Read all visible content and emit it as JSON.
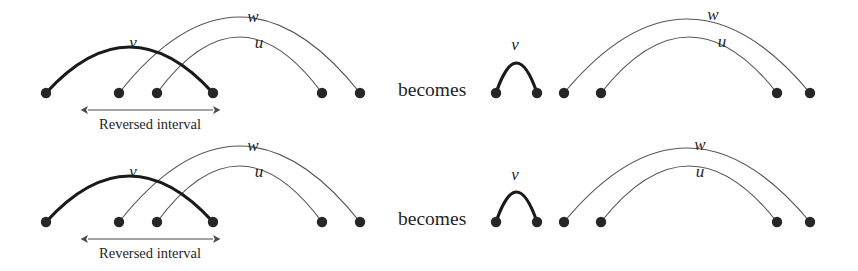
{
  "figure": {
    "width": 858,
    "height": 271,
    "background": "#ffffff",
    "colors": {
      "node": "#262626",
      "thick_arc": "#1a1a1a",
      "thin_arc": "#555555",
      "arrow": "#4a4a4a",
      "text": "#1f1f1f"
    },
    "stroke_widths": {
      "thick_arc": 3.2,
      "thin_arc": 1.1,
      "arrow": 1.1
    },
    "node_radius": 5.2
  },
  "connector": {
    "top_label": "becomes",
    "bottom_label": "becomes"
  },
  "labels": {
    "v": "v",
    "u": "u",
    "w": "w",
    "reversed_interval": "Reversed interval"
  },
  "panels": [
    {
      "id": "top-left",
      "name": "top-left-before-panel",
      "baseline_y": 93,
      "nodes": [
        {
          "id": "n1",
          "x": 46,
          "y": 93
        },
        {
          "id": "n2",
          "x": 119,
          "y": 93
        },
        {
          "id": "n3",
          "x": 157,
          "y": 93
        },
        {
          "id": "n4",
          "x": 213,
          "y": 93
        },
        {
          "id": "n5",
          "x": 322,
          "y": 93
        },
        {
          "id": "n6",
          "x": 360,
          "y": 93
        }
      ],
      "arcs": [
        {
          "label": "v",
          "from": "n1",
          "to": "n4",
          "style": "thick",
          "height": 46,
          "label_x": 133,
          "label_y": 48
        },
        {
          "label": "w",
          "from": "n2",
          "to": "n6",
          "style": "thin",
          "height": 76,
          "label_x": 253,
          "label_y": 22
        },
        {
          "label": "u",
          "from": "n3",
          "to": "n5",
          "style": "thin",
          "height": 56,
          "label_x": 259,
          "label_y": 48
        }
      ],
      "annotation": {
        "text": "Reversed interval",
        "arrow_from_x": 88,
        "arrow_to_x": 213,
        "arrow_y": 110,
        "text_x": 150,
        "text_y": 129
      }
    },
    {
      "id": "top-right",
      "name": "top-right-after-panel",
      "baseline_y": 93,
      "nodes": [
        {
          "id": "m1",
          "x": 496,
          "y": 93
        },
        {
          "id": "m2",
          "x": 537,
          "y": 93
        },
        {
          "id": "m3",
          "x": 564,
          "y": 93
        },
        {
          "id": "m4",
          "x": 601,
          "y": 93
        },
        {
          "id": "m5",
          "x": 777,
          "y": 93
        },
        {
          "id": "m6",
          "x": 810,
          "y": 93
        }
      ],
      "arcs": [
        {
          "label": "v",
          "from": "m1",
          "to": "m2",
          "style": "thick",
          "height": 30,
          "label_x": 515,
          "label_y": 50
        },
        {
          "label": "w",
          "from": "m3",
          "to": "m6",
          "style": "thin",
          "height": 74,
          "label_x": 713,
          "label_y": 20
        },
        {
          "label": "u",
          "from": "m4",
          "to": "m5",
          "style": "thin",
          "height": 56,
          "label_x": 722,
          "label_y": 47
        }
      ],
      "annotation": null
    },
    {
      "id": "bottom-left",
      "name": "bottom-left-before-panel",
      "baseline_y": 222,
      "nodes": [
        {
          "id": "b1",
          "x": 46,
          "y": 222
        },
        {
          "id": "b2",
          "x": 119,
          "y": 222
        },
        {
          "id": "b3",
          "x": 157,
          "y": 222
        },
        {
          "id": "b4",
          "x": 213,
          "y": 222
        },
        {
          "id": "b5",
          "x": 322,
          "y": 222
        },
        {
          "id": "b6",
          "x": 360,
          "y": 222
        }
      ],
      "arcs": [
        {
          "label": "v",
          "from": "b1",
          "to": "b4",
          "style": "thick",
          "height": 46,
          "label_x": 133,
          "label_y": 177
        },
        {
          "label": "w",
          "from": "b2",
          "to": "b6",
          "style": "thin",
          "height": 76,
          "label_x": 253,
          "label_y": 151
        },
        {
          "label": "u",
          "from": "b3",
          "to": "b5",
          "style": "thin",
          "height": 56,
          "label_x": 259,
          "label_y": 177
        }
      ],
      "annotation": {
        "text": "Reversed interval",
        "arrow_from_x": 88,
        "arrow_to_x": 213,
        "arrow_y": 239,
        "text_x": 150,
        "text_y": 258
      }
    },
    {
      "id": "bottom-right",
      "name": "bottom-right-after-panel",
      "baseline_y": 222,
      "nodes": [
        {
          "id": "c1",
          "x": 496,
          "y": 222
        },
        {
          "id": "c2",
          "x": 537,
          "y": 222
        },
        {
          "id": "c3",
          "x": 564,
          "y": 222
        },
        {
          "id": "c4",
          "x": 601,
          "y": 222
        },
        {
          "id": "c5",
          "x": 777,
          "y": 222
        },
        {
          "id": "c6",
          "x": 810,
          "y": 222
        }
      ],
      "arcs": [
        {
          "label": "v",
          "from": "c1",
          "to": "c2",
          "style": "thick",
          "height": 30,
          "label_x": 515,
          "label_y": 180
        },
        {
          "label": "w",
          "from": "c3",
          "to": "c6",
          "style": "thin",
          "height": 74,
          "label_x": 700,
          "label_y": 150
        },
        {
          "label": "u",
          "from": "c4",
          "to": "c5",
          "style": "thin",
          "height": 56,
          "label_x": 700,
          "label_y": 177
        }
      ],
      "annotation": null
    }
  ],
  "connector_positions": [
    {
      "x": 398,
      "y": 96,
      "panel": "top"
    },
    {
      "x": 398,
      "y": 225,
      "panel": "bottom"
    }
  ]
}
